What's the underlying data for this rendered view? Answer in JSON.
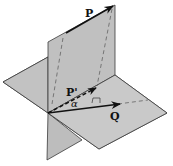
{
  "figure": {
    "colors": {
      "plane_fill": "#c6c6c6",
      "plane_fill_dark": "#b9b9b9",
      "edge": "#3a3a3a",
      "vector": "#111111",
      "dashed": "#555555"
    },
    "labels": {
      "vector_p": "P",
      "vector_p_prime": "P'",
      "vector_q": "Q",
      "angle": "α"
    }
  }
}
